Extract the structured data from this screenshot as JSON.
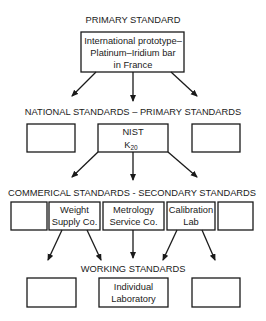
{
  "diagram": {
    "levels": [
      {
        "label": "PRIMARY STANDARD",
        "boxes": [
          {
            "lines": [
              "International prototype–",
              "Platinum–Iridium bar",
              "in France"
            ]
          }
        ]
      },
      {
        "label": "NATIONAL STANDARDS – PRIMARY STANDARDS",
        "boxes": [
          {
            "lines": []
          },
          {
            "lines": [
              "NIST"
            ],
            "symbol": "K",
            "subscript": "20"
          },
          {
            "lines": []
          }
        ]
      },
      {
        "label": "COMMERICAL STANDARDS - SECONDARY STANDARDS",
        "boxes": [
          {
            "lines": []
          },
          {
            "lines": [
              "Weight",
              "Supply Co."
            ]
          },
          {
            "lines": [
              "Metrology",
              "Service Co."
            ]
          },
          {
            "lines": [
              "Calibration",
              "Lab"
            ]
          },
          {
            "lines": []
          }
        ]
      },
      {
        "label": "WORKING STANDARDS",
        "boxes": [
          {
            "lines": []
          },
          {
            "lines": [
              "Individual",
              "Laboratory"
            ]
          },
          {
            "lines": []
          }
        ]
      }
    ],
    "colors": {
      "line": "#1a1a1a",
      "background": "#ffffff"
    }
  }
}
